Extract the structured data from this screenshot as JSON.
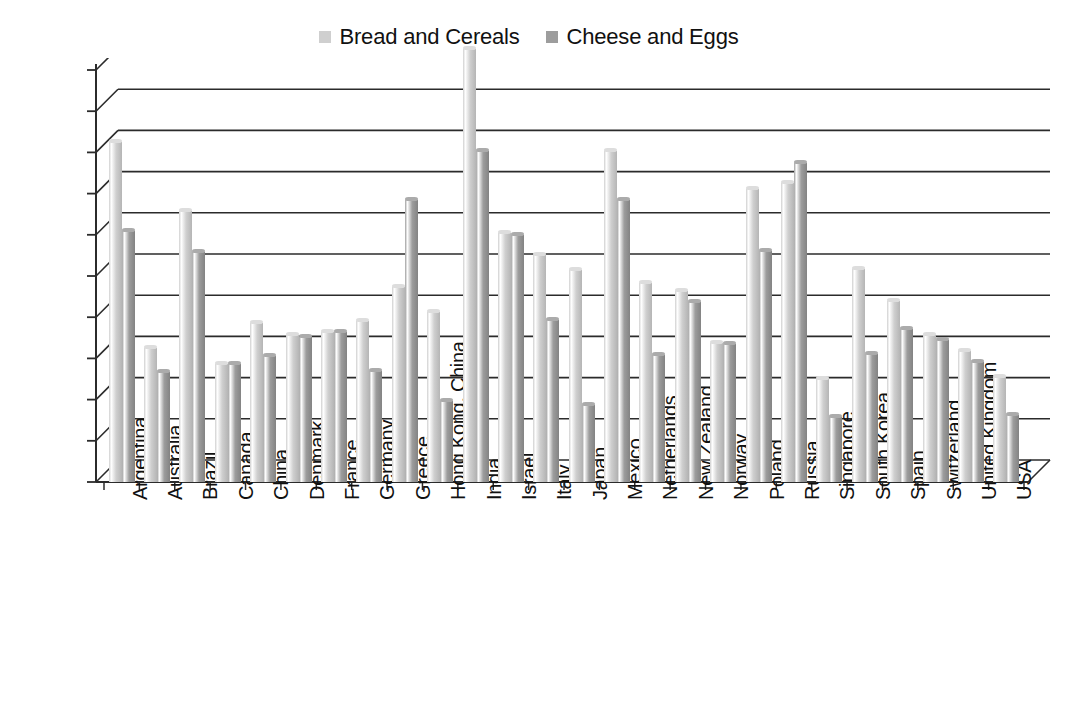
{
  "legend": {
    "position": "top-center",
    "items": [
      {
        "label": "Bread and Cereals",
        "color": "#cfcfcf",
        "swatch_name": "legend-swatch-bread-and-cereals"
      },
      {
        "label": "Cheese and Eggs",
        "color": "#9d9d9d",
        "swatch_name": "legend-swatch-cheese-and-eggs"
      }
    ]
  },
  "axis": {
    "y_ticks": [
      "0.00%",
      "0.50%",
      "1.00%",
      "1.50%",
      "2.00%",
      "2.50%",
      "3.00%",
      "3.50%",
      "4.00%",
      "4.50%",
      "5.00%"
    ],
    "y_min": 0,
    "y_max": 5,
    "y_step": 0.5
  },
  "chart_data": {
    "type": "bar",
    "title": "",
    "subtitle": "",
    "xlabel": "",
    "ylabel": "",
    "ylim": [
      0,
      5
    ],
    "ytick_values": [
      0,
      0.5,
      1.0,
      1.5,
      2.0,
      2.5,
      3.0,
      3.5,
      4.0,
      4.5,
      5.0
    ],
    "ytick_labels": [
      "0.00%",
      "0.50%",
      "1.00%",
      "1.50%",
      "2.00%",
      "2.50%",
      "3.00%",
      "3.50%",
      "4.00%",
      "4.50%",
      "5.00%"
    ],
    "grid": true,
    "grid_axis": "y",
    "style": "3d-column",
    "legend": [
      "Bread and Cereals",
      "Cheese and Eggs"
    ],
    "legend_position": "top-center",
    "units": "percent",
    "categories": [
      "Argentina",
      "Australia",
      "Brazil",
      "Canada",
      "China",
      "Denmark",
      "France",
      "Germany",
      "Greece",
      "Hong Kong, China",
      "India",
      "Israel",
      "Italy",
      "Japan",
      "Mexico",
      "Netherlands",
      "New Zealand",
      "Norway",
      "Poland",
      "Russia",
      "Singapore",
      "South Korea",
      "Spain",
      "Switzerland",
      "United Kingdom",
      "USA"
    ],
    "series": [
      {
        "name": "Bread and Cereals",
        "color": "#cfcfcf",
        "values": [
          4.13,
          1.63,
          3.29,
          1.43,
          1.93,
          1.78,
          1.82,
          1.96,
          2.37,
          2.06,
          5.26,
          3.02,
          2.76,
          2.57,
          4.02,
          2.42,
          2.32,
          1.69,
          3.55,
          3.63,
          1.25,
          2.58,
          2.2,
          1.79,
          1.59,
          1.28
        ]
      },
      {
        "name": "Cheese and Eggs",
        "color": "#9d9d9d",
        "values": [
          3.05,
          1.33,
          2.79,
          1.43,
          1.53,
          1.76,
          1.82,
          1.35,
          3.42,
          0.98,
          4.02,
          3.0,
          1.97,
          0.94,
          3.42,
          1.54,
          2.18,
          1.67,
          2.8,
          3.87,
          0.79,
          1.55,
          1.86,
          1.72,
          1.46,
          0.81
        ]
      }
    ]
  }
}
